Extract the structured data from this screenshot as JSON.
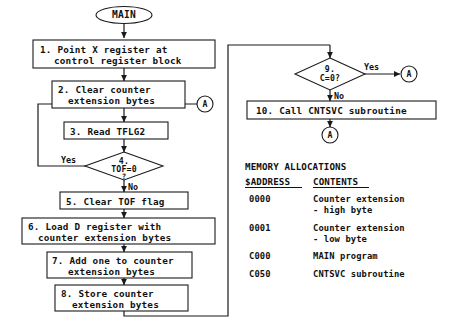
{
  "diagram": {
    "colors": {
      "ink": "#111111",
      "stroke": "#1a1a1a",
      "background": "#ffffff"
    },
    "terminal_start": "MAIN",
    "steps": [
      {
        "id": "s1",
        "line1": "1. Point X register at",
        "line2": "control register block"
      },
      {
        "id": "s2",
        "line1": "2. Clear counter",
        "line2": "extension bytes"
      },
      {
        "id": "s3",
        "line1": "3. Read TFLG2",
        "line2": ""
      },
      {
        "id": "s5",
        "line1": "5. Clear TOF flag",
        "line2": ""
      },
      {
        "id": "s6",
        "line1": "6. Load D register with",
        "line2": "counter extension bytes"
      },
      {
        "id": "s7",
        "line1": "7. Add one to counter",
        "line2": "extension bytes"
      },
      {
        "id": "s8",
        "line1": "8. Store counter",
        "line2": "extension bytes"
      },
      {
        "id": "s10",
        "line1": "10. Call CNTSVC subroutine",
        "line2": ""
      }
    ],
    "decisions": [
      {
        "id": "d4",
        "line1": "4.",
        "line2": "TOF=0",
        "line3": "?",
        "yes": "Yes",
        "no": "No"
      },
      {
        "id": "d9",
        "line1": "9.",
        "line2": "C=0?",
        "line3": "",
        "yes": "Yes",
        "no": "No"
      }
    ],
    "connectors": [
      {
        "id": "a-right",
        "label": "A"
      },
      {
        "id": "a-yes",
        "label": "A"
      },
      {
        "id": "a-bottom",
        "label": "A"
      }
    ]
  },
  "memory": {
    "title": "MEMORY ALLOCATIONS",
    "header_address": "$ADDRESS",
    "header_contents": "CONTENTS",
    "rows": [
      {
        "address": "0000",
        "contents_line1": "Counter extension",
        "contents_line2": "- high byte"
      },
      {
        "address": "0001",
        "contents_line1": "Counter extension",
        "contents_line2": "- low byte"
      },
      {
        "address": "C000",
        "contents_line1": "MAIN program",
        "contents_line2": ""
      },
      {
        "address": "C050",
        "contents_line1": "CNTSVC subroutine",
        "contents_line2": ""
      }
    ]
  }
}
